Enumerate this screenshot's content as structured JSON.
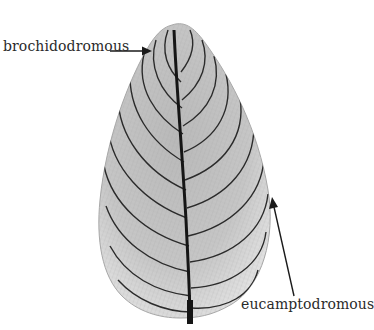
{
  "figure": {
    "labels": [
      {
        "id": "brochidodromous",
        "text": "brochidodromous"
      },
      {
        "id": "eucamptodromous",
        "text": "eucamptodromous"
      }
    ],
    "colors": {
      "background": "#ffffff",
      "leaf_fill": "#c9c9c9",
      "leaf_fill_light": "#e6e6e6",
      "vein": "#2b2b2b",
      "midrib": "#151515",
      "arrow": "#1a1a1a",
      "text": "#2a2a2a"
    }
  }
}
